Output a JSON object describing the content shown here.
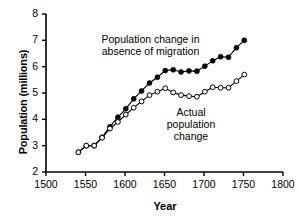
{
  "chart_data": {
    "type": "line",
    "title": "",
    "xlabel": "Year",
    "ylabel": "Population (millions)",
    "xlim": [
      1500,
      1800
    ],
    "ylim": [
      2,
      8
    ],
    "xticks": [
      1500,
      1550,
      1600,
      1650,
      1700,
      1750,
      1800
    ],
    "yticks": [
      2,
      3,
      4,
      5,
      6,
      7,
      8
    ],
    "grid": false,
    "legend_position": "inline-annotations",
    "annotations": [
      {
        "name": "absence-of-migration-label",
        "text_lines": [
          "Population change in",
          "absence of migration"
        ],
        "x": 1612,
        "y": 6.9
      },
      {
        "name": "actual-population-label",
        "text_lines": [
          "Actual",
          "population",
          "change"
        ],
        "x": 1688,
        "y": 4.3
      }
    ],
    "series": [
      {
        "name": "Population change in absence of migration",
        "marker": "filled-circle",
        "color": "#000000",
        "x": [
          1541,
          1551,
          1561,
          1571,
          1581,
          1591,
          1601,
          1611,
          1621,
          1631,
          1641,
          1651,
          1661,
          1671,
          1681,
          1691,
          1701,
          1711,
          1721,
          1731,
          1741,
          1751
        ],
        "values": [
          2.75,
          3.0,
          3.0,
          3.32,
          3.72,
          4.08,
          4.4,
          4.78,
          5.08,
          5.38,
          5.6,
          5.85,
          5.88,
          5.8,
          5.84,
          5.83,
          6.02,
          6.22,
          6.38,
          6.36,
          6.72,
          7.0
        ]
      },
      {
        "name": "Actual population change",
        "marker": "open-circle",
        "color": "#000000",
        "x": [
          1541,
          1551,
          1561,
          1571,
          1581,
          1591,
          1601,
          1611,
          1621,
          1631,
          1641,
          1651,
          1661,
          1671,
          1681,
          1691,
          1701,
          1711,
          1721,
          1731,
          1741,
          1751
        ],
        "values": [
          2.75,
          3.0,
          3.0,
          3.3,
          3.65,
          3.9,
          4.18,
          4.44,
          4.68,
          4.92,
          5.05,
          5.18,
          5.02,
          4.92,
          4.88,
          4.86,
          5.05,
          5.22,
          5.2,
          5.2,
          5.45,
          5.7
        ]
      }
    ]
  },
  "axes": {
    "x_tick_labels": [
      "1500",
      "1550",
      "1600",
      "1650",
      "1700",
      "1750",
      "1800"
    ],
    "y_tick_labels": [
      "2",
      "3",
      "4",
      "5",
      "6",
      "7",
      "8"
    ],
    "x_axis_title": "Year",
    "y_axis_title": "Population (millions)"
  },
  "annotations": {
    "absence": {
      "line1": "Population change in",
      "line2": "absence of migration"
    },
    "actual": {
      "line1": "Actual",
      "line2": "population",
      "line3": "change"
    }
  },
  "colors": {
    "axis": "#000000",
    "line": "#000000",
    "marker_fill_solid": "#000000",
    "marker_fill_open": "#ffffff",
    "background": "#ffffff"
  }
}
